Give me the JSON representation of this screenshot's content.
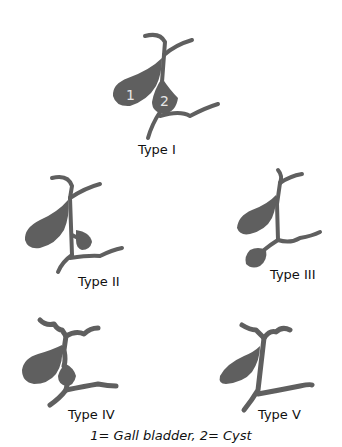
{
  "diagram": {
    "title": "",
    "colors": {
      "shape": "#5f5f5f",
      "background": "#ffffff",
      "number": "#e6e6e6"
    },
    "panels": [
      {
        "id": "type-1",
        "label": "Type I",
        "numbers": [
          "1",
          "2"
        ]
      },
      {
        "id": "type-2",
        "label": "Type II"
      },
      {
        "id": "type-3",
        "label": "Type III"
      },
      {
        "id": "type-4",
        "label": "Type IV"
      },
      {
        "id": "type-5",
        "label": "Type V"
      }
    ],
    "legend": "1= Gall bladder, 2= Cyst"
  }
}
